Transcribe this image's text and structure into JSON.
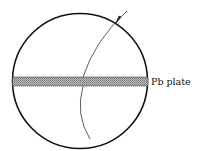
{
  "diagram": {
    "labels": {
      "plate": "Pb plate"
    },
    "elements": {
      "chamber": "circle",
      "plate": "lead plate band across chamber",
      "track": "curved particle track entering from upper right",
      "arrow": "arrow indicating direction of incoming particle"
    },
    "colors": {
      "stroke": "#111111",
      "plate_fill": "#9a9a9a",
      "background": "#ffffff"
    }
  }
}
